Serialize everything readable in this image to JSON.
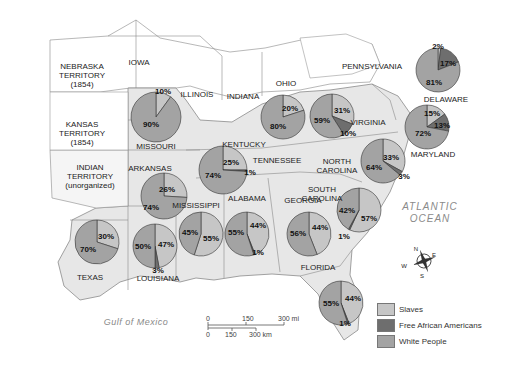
{
  "colors": {
    "slaves": "#c6c6c6",
    "free": "#6e6e6e",
    "white": "#a3a3a3",
    "state_fill_slave": "#e6e6e6",
    "state_fill_free": "#ffffff",
    "border": "#8a8a8a"
  },
  "labels": {
    "nebraska": "NEBRASKA\nTERRITORY\n(1854)",
    "kansas": "KANSAS\nTERRITORY\n(1854)",
    "indian": "INDIAN\nTERRITORY\n(unorganized)",
    "iowa": "IOWA",
    "illinois": "ILLINOIS",
    "indiana": "INDIANA",
    "ohio": "OHIO",
    "pennsylvania": "PENNSYLVANIA",
    "delaware": "DELAWARE",
    "maryland": "MARYLAND",
    "virginia": "VIRGINIA",
    "kentucky": "KENTUCKY",
    "tennessee": "TENNESSEE",
    "missouri": "MISSOURI",
    "arkansas": "ARKANSAS",
    "north_carolina": "NORTH\nCAROLINA",
    "south_carolina": "SOUTH\nCAROLINA",
    "mississippi": "MISSISSIPPI",
    "alabama": "ALABAMA",
    "georgia": "GEORGIA",
    "texas": "TEXAS",
    "louisiana": "LOUISIANA",
    "florida": "FLORIDA",
    "atlantic": "ATLANTIC\nOCEAN",
    "gulf": "Gulf of Mexico"
  },
  "compass": {
    "n": "N",
    "e": "E",
    "s": "S",
    "w": "W"
  },
  "scale": {
    "mi_0": "0",
    "mi_150": "150",
    "mi_300": "300 mi",
    "km_0": "0",
    "km_150": "150",
    "km_300": "300 km"
  },
  "legend": [
    {
      "label": "Slaves",
      "key": "slaves"
    },
    {
      "label": "Free African Americans",
      "key": "free"
    },
    {
      "label": "White People",
      "key": "white"
    }
  ],
  "chart_data": {
    "type": "pie",
    "legend": [
      "Slaves",
      "Free African Americans",
      "White People"
    ],
    "series_order": [
      "slaves",
      "free",
      "white"
    ],
    "pies": [
      {
        "state": "Missouri",
        "cx": 156,
        "cy": 117,
        "r": 25,
        "slaves": 10,
        "free": 0,
        "white": 90,
        "labels": [
          {
            "t": "10%",
            "x": 163,
            "y": 91
          },
          {
            "t": "90%",
            "x": 151,
            "y": 124
          }
        ]
      },
      {
        "state": "Kentucky",
        "cx": 283,
        "cy": 117,
        "r": 22,
        "slaves": 20,
        "free": 0,
        "white": 80,
        "labels": [
          {
            "t": "20%",
            "x": 290,
            "y": 108
          },
          {
            "t": "80%",
            "x": 278,
            "y": 126
          }
        ]
      },
      {
        "state": "Virginia",
        "cx": 332,
        "cy": 116,
        "r": 22,
        "slaves": 31,
        "free": 10,
        "white": 59,
        "labels": [
          {
            "t": "31%",
            "x": 342,
            "y": 110
          },
          {
            "t": "59%",
            "x": 322,
            "y": 120
          },
          {
            "t": "10%",
            "x": 348,
            "y": 133
          }
        ]
      },
      {
        "state": "Delaware",
        "cx": 438,
        "cy": 70,
        "r": 22,
        "slaves": 2,
        "free": 17,
        "white": 81,
        "labels": [
          {
            "t": "2%",
            "x": 438,
            "y": 46
          },
          {
            "t": "17%",
            "x": 448,
            "y": 63
          },
          {
            "t": "81%",
            "x": 434,
            "y": 82
          }
        ]
      },
      {
        "state": "Maryland",
        "cx": 427,
        "cy": 127,
        "r": 22,
        "slaves": 15,
        "free": 13,
        "white": 72,
        "labels": [
          {
            "t": "15%",
            "x": 432,
            "y": 113
          },
          {
            "t": "13%",
            "x": 442,
            "y": 125
          },
          {
            "t": "72%",
            "x": 423,
            "y": 133
          }
        ]
      },
      {
        "state": "Tennessee",
        "cx": 223,
        "cy": 170,
        "r": 24,
        "slaves": 25,
        "free": 1,
        "white": 74,
        "labels": [
          {
            "t": "25%",
            "x": 231,
            "y": 162
          },
          {
            "t": "74%",
            "x": 213,
            "y": 175
          },
          {
            "t": "1%",
            "x": 250,
            "y": 172
          }
        ]
      },
      {
        "state": "North Carolina",
        "cx": 383,
        "cy": 161,
        "r": 22,
        "slaves": 33,
        "free": 3,
        "white": 64,
        "labels": [
          {
            "t": "33%",
            "x": 391,
            "y": 157
          },
          {
            "t": "64%",
            "x": 374,
            "y": 167
          },
          {
            "t": "3%",
            "x": 404,
            "y": 176
          }
        ]
      },
      {
        "state": "Arkansas",
        "cx": 164,
        "cy": 196,
        "r": 23,
        "slaves": 26,
        "free": 0,
        "white": 74,
        "labels": [
          {
            "t": "26%",
            "x": 167,
            "y": 189
          },
          {
            "t": "74%",
            "x": 151,
            "y": 207
          }
        ]
      },
      {
        "state": "South Carolina",
        "cx": 359,
        "cy": 210,
        "r": 22,
        "slaves": 57,
        "free": 1,
        "white": 42,
        "labels": [
          {
            "t": "57%",
            "x": 369,
            "y": 218
          },
          {
            "t": "42%",
            "x": 347,
            "y": 210
          },
          {
            "t": "1%",
            "x": 344,
            "y": 236
          }
        ]
      },
      {
        "state": "Mississippi",
        "cx": 201,
        "cy": 234,
        "r": 22,
        "slaves": 55,
        "free": 0,
        "white": 45,
        "labels": [
          {
            "t": "55%",
            "x": 211,
            "y": 238
          },
          {
            "t": "45%",
            "x": 190,
            "y": 232
          }
        ]
      },
      {
        "state": "Alabama",
        "cx": 247,
        "cy": 234,
        "r": 22,
        "slaves": 44,
        "free": 1,
        "white": 55,
        "labels": [
          {
            "t": "44%",
            "x": 258,
            "y": 225
          },
          {
            "t": "55%",
            "x": 236,
            "y": 232
          },
          {
            "t": "1%",
            "x": 258,
            "y": 252
          }
        ]
      },
      {
        "state": "Georgia",
        "cx": 309,
        "cy": 234,
        "r": 22,
        "slaves": 44,
        "free": 0,
        "white": 56,
        "labels": [
          {
            "t": "44%",
            "x": 320,
            "y": 227
          },
          {
            "t": "56%",
            "x": 298,
            "y": 233
          }
        ]
      },
      {
        "state": "Texas",
        "cx": 97,
        "cy": 242,
        "r": 22,
        "slaves": 30,
        "free": 0,
        "white": 70,
        "labels": [
          {
            "t": "30%",
            "x": 106,
            "y": 236
          },
          {
            "t": "70%",
            "x": 88,
            "y": 249
          }
        ]
      },
      {
        "state": "Louisiana",
        "cx": 155,
        "cy": 246,
        "r": 22,
        "slaves": 47,
        "free": 3,
        "white": 50,
        "labels": [
          {
            "t": "47%",
            "x": 166,
            "y": 244
          },
          {
            "t": "50%",
            "x": 143,
            "y": 246
          },
          {
            "t": "3%",
            "x": 158,
            "y": 270
          }
        ]
      },
      {
        "state": "Florida",
        "cx": 341,
        "cy": 303,
        "r": 22,
        "slaves": 44,
        "free": 1,
        "white": 55,
        "labels": [
          {
            "t": "44%",
            "x": 353,
            "y": 298
          },
          {
            "t": "55%",
            "x": 331,
            "y": 303
          },
          {
            "t": "1%",
            "x": 345,
            "y": 323
          }
        ]
      }
    ]
  }
}
